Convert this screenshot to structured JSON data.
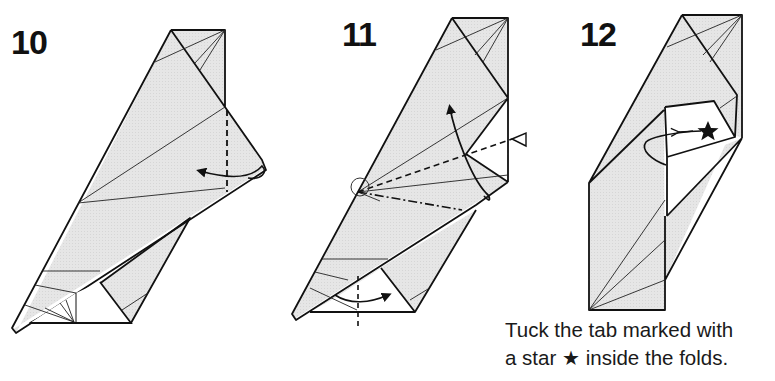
{
  "steps": [
    {
      "number": "10",
      "action": "valley-fold tip to the left along dashed line"
    },
    {
      "number": "11",
      "action": "squash/fold along valley (dashed) and mountain (dash-dot) lines; swing flap up; fold bottom triangle across"
    },
    {
      "number": "12",
      "action": "tuck starred tab inside the folds"
    }
  ],
  "caption": {
    "line1": "Tuck the tab marked with",
    "line2_pre": "a star",
    "star": "★",
    "line2_post": "inside the folds."
  },
  "colors": {
    "paper_fill": "#e3e3e3",
    "line": "#111111",
    "background": "#ffffff"
  },
  "line_legend": {
    "dashed": "valley fold",
    "dash_dot": "mountain fold",
    "hollow_triangle": "squash / push here",
    "circle": "reference point"
  }
}
